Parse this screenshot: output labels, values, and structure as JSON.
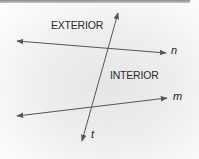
{
  "diagram": {
    "labels": {
      "exterior": "EXTERIOR",
      "interior": "INTERIOR"
    },
    "lines": [
      {
        "name": "n",
        "x1": 17,
        "y1": 41,
        "x2": 166,
        "y2": 53,
        "arrows": "both"
      },
      {
        "name": "m",
        "x1": 17,
        "y1": 116,
        "x2": 167,
        "y2": 98,
        "arrows": "both"
      },
      {
        "name": "t",
        "x1": 118,
        "y1": 13,
        "x2": 82,
        "y2": 141,
        "arrows": "both"
      }
    ],
    "line_labels": {
      "n": "n",
      "m": "m",
      "t": "t"
    },
    "line_color": "#555555"
  }
}
